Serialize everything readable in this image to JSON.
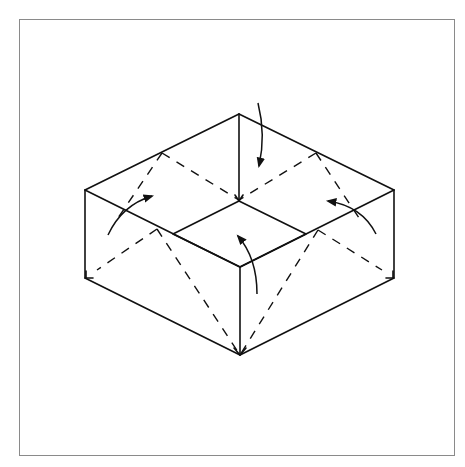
{
  "diagram": {
    "type": "origami-fold-instruction",
    "colors": {
      "line": "#111111",
      "frame": "#8a8a8a",
      "background": "#ffffff"
    },
    "frame": {
      "x": 19,
      "y": 19,
      "width": 436,
      "height": 437
    },
    "outer_edges": [
      {
        "name": "top-left-rim",
        "from": [
          85,
          190
        ],
        "to": [
          239,
          114
        ]
      },
      {
        "name": "top-right-rim",
        "from": [
          239,
          114
        ],
        "to": [
          394,
          190
        ]
      },
      {
        "name": "back-vertical-edge",
        "from": [
          239,
          114
        ],
        "to": [
          239,
          201
        ]
      },
      {
        "name": "left-vertical-edge",
        "from": [
          85,
          190
        ],
        "to": [
          85,
          278
        ]
      },
      {
        "name": "right-vertical-edge",
        "from": [
          394,
          190
        ],
        "to": [
          394,
          278
        ]
      },
      {
        "name": "front-vertical-edge",
        "from": [
          240,
          267
        ],
        "to": [
          240,
          355
        ]
      },
      {
        "name": "left-top-edge",
        "from": [
          85,
          190
        ],
        "to": [
          240,
          267
        ]
      },
      {
        "name": "right-top-edge",
        "from": [
          394,
          190
        ],
        "to": [
          240,
          267
        ]
      },
      {
        "name": "left-bottom-edge",
        "from": [
          85,
          278
        ],
        "to": [
          240,
          355
        ]
      },
      {
        "name": "right-bottom-edge",
        "from": [
          394,
          278
        ],
        "to": [
          240,
          355
        ]
      }
    ],
    "inner_square": [
      [
        239,
        201
      ],
      [
        306,
        234
      ],
      [
        240,
        267
      ],
      [
        173,
        234
      ]
    ],
    "fold_lines_dashed": [
      {
        "name": "back-left-diag-a",
        "from": [
          162,
          153
        ],
        "to": [
          239,
          200
        ]
      },
      {
        "name": "back-left-diag-b",
        "from": [
          162,
          153
        ],
        "to": [
          118,
          218
        ]
      },
      {
        "name": "back-right-diag-a",
        "from": [
          316,
          153
        ],
        "to": [
          239,
          200
        ]
      },
      {
        "name": "back-right-diag-b",
        "from": [
          316,
          153
        ],
        "to": [
          359,
          218
        ]
      },
      {
        "name": "front-left-diag-a",
        "from": [
          157,
          229
        ],
        "to": [
          240,
          355
        ]
      },
      {
        "name": "front-left-diag-b",
        "from": [
          157,
          229
        ],
        "to": [
          97,
          270
        ]
      },
      {
        "name": "front-right-diag-a",
        "from": [
          318,
          230
        ],
        "to": [
          240,
          355
        ]
      },
      {
        "name": "front-right-diag-b",
        "from": [
          318,
          230
        ],
        "to": [
          382,
          270
        ]
      }
    ],
    "arrows": [
      {
        "name": "top-fold-arrow",
        "path": "M258,103 Q266,135 259,166",
        "direction": "down"
      },
      {
        "name": "left-fold-arrow",
        "path": "M108,235 Q122,205 152,196",
        "direction": "up-right"
      },
      {
        "name": "right-fold-arrow",
        "path": "M376,234 Q362,206 328,201",
        "direction": "up-left"
      },
      {
        "name": "center-fold-arrow",
        "path": "M257,294 Q257,258 238,236",
        "direction": "up"
      }
    ]
  }
}
